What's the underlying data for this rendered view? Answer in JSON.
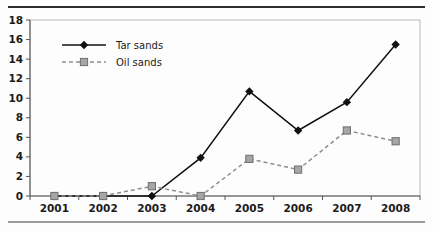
{
  "chart_data": {
    "type": "line",
    "title": "",
    "xlabel": "",
    "ylabel": "",
    "categories": [
      "2001",
      "2002",
      "2003",
      "2004",
      "2005",
      "2006",
      "2007",
      "2008"
    ],
    "series": [
      {
        "name": "Tar sands",
        "marker": "diamond",
        "line_style": "solid",
        "color": "#111111",
        "values": [
          0,
          0,
          0,
          3.9,
          10.7,
          6.7,
          9.6,
          15.5
        ]
      },
      {
        "name": "Oil sands",
        "marker": "square",
        "line_style": "dashed",
        "color": "#a6a6a6",
        "values": [
          0,
          0,
          1.0,
          0,
          3.8,
          2.7,
          6.7,
          5.6
        ]
      }
    ],
    "ylim": [
      0,
      18
    ],
    "yticks": [
      0,
      2,
      4,
      6,
      8,
      10,
      12,
      14,
      16,
      18
    ],
    "ytick_labels": [
      "0",
      "2",
      "4",
      "6",
      "8",
      "10",
      "12",
      "14",
      "16",
      "18"
    ],
    "grid": false,
    "legend_position": "top-left",
    "legend": [
      "Tar sands",
      "Oil sands"
    ]
  },
  "decor": {
    "rule_top_color": "#2e2e2e",
    "rule_bottom_color": "#9b9b9b",
    "frame_color": "#b9b9b9",
    "axis_color": "#555555",
    "background": "#fdfdfd"
  }
}
